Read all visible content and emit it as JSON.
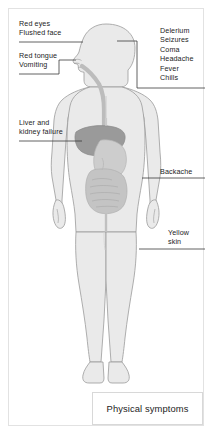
{
  "figure": {
    "caption": "Physical symptoms",
    "colors": {
      "frame_border": "#e2e2e2",
      "body_fill": "#eaeaea",
      "body_outline": "#9b9b9b",
      "organ_liver": "#9a9a9a",
      "organ_stomach": "#c9c9c9",
      "organ_intestine": "#c4c4c4",
      "airway": "#bcbcbc",
      "leader_line": "#3a3a3a",
      "text": "#1d1d1d"
    }
  },
  "annotations": [
    {
      "id": "red-eyes-flushed-face",
      "side": "left",
      "text": "Red eyes\nFlushed face",
      "lines": [
        "Red eyes",
        "Flushed face"
      ],
      "target": "eye / face",
      "x": 19,
      "y": 19
    },
    {
      "id": "red-tongue-vomiting",
      "side": "left",
      "text": "Red tongue\nVomiting",
      "lines": [
        "Red tongue",
        "Vomiting"
      ],
      "target": "mouth / tongue",
      "x": 19,
      "y": 51
    },
    {
      "id": "liver-and-kidney-failure",
      "side": "left",
      "text": "Liver and\nkidney failure",
      "lines": [
        "Liver and",
        "kidney failure"
      ],
      "target": "liver",
      "x": 19,
      "y": 118
    },
    {
      "id": "delerium-seizures-coma-headache-fever-chills",
      "side": "right",
      "text": "Delerium\nSeizures\nComa\nHeadache\nFever\nChills",
      "lines": [
        "Delerium",
        "Seizures",
        "Coma",
        "Headache",
        "Fever",
        "Chills"
      ],
      "target": "head / brain",
      "x": 160,
      "y": 26
    },
    {
      "id": "backache",
      "side": "right",
      "text": "Backache",
      "lines": [
        "Backache"
      ],
      "target": "lower back",
      "x": 160,
      "y": 167
    },
    {
      "id": "yellow-skin",
      "side": "right",
      "text": "Yellow\nskin",
      "lines": [
        "Yellow",
        "skin"
      ],
      "target": "skin / thigh",
      "x": 168,
      "y": 228
    }
  ]
}
